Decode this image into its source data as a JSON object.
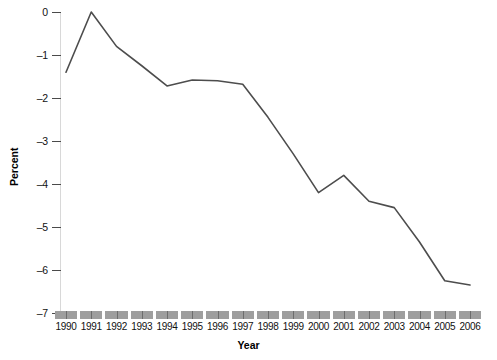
{
  "chart_data": {
    "type": "line",
    "title": "",
    "xlabel": "Year",
    "ylabel": "Percent",
    "categories": [
      1990,
      1991,
      1992,
      1993,
      1994,
      1995,
      1996,
      1997,
      1998,
      1999,
      2000,
      2001,
      2002,
      2003,
      2004,
      2005,
      2006
    ],
    "x_tick_labels": [
      "1990",
      "1991",
      "1992",
      "1993",
      "1994",
      "1995",
      "1996",
      "1997",
      "1998",
      "1999",
      "2000",
      "2001",
      "2002",
      "2003",
      "2004",
      "2005",
      "2006"
    ],
    "values": [
      -1.4,
      0.0,
      -0.8,
      -1.25,
      -1.72,
      -1.58,
      -1.6,
      -1.68,
      -2.45,
      -3.3,
      -4.2,
      -3.8,
      -4.4,
      -4.55,
      -5.35,
      -6.25,
      -6.35
    ],
    "series": [
      {
        "name": "Percent",
        "values": [
          -1.4,
          0.0,
          -0.8,
          -1.25,
          -1.72,
          -1.58,
          -1.6,
          -1.68,
          -2.45,
          -3.3,
          -4.2,
          -3.8,
          -4.4,
          -4.55,
          -5.35,
          -6.25,
          -6.35
        ],
        "color": "#4d4d4d"
      }
    ],
    "ylim": [
      -7,
      0
    ],
    "y_tick_values": [
      0,
      -1,
      -2,
      -3,
      -4,
      -5,
      -6,
      -7
    ],
    "y_tick_labels": [
      "0",
      "–1",
      "–2",
      "–3",
      "–4",
      "–5",
      "–6",
      "–7"
    ],
    "grid": false,
    "legend": false,
    "legend_position": "none",
    "markers": false,
    "line_color": "#4d4d4d",
    "axis_color": "#4a4a4a",
    "tick_band_color": "#9e9e9e",
    "background_color": "#ffffff"
  }
}
